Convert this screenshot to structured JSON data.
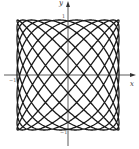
{
  "chart_data": {
    "type": "line",
    "subtype": "parametric-lissajous",
    "title": "",
    "xlabel": "x",
    "ylabel": "y",
    "x_tick_labels": [
      "−1",
      "1"
    ],
    "y_tick_labels": [
      "1",
      "−1"
    ],
    "xlim": [
      -1,
      1
    ],
    "ylim": [
      -1,
      1
    ],
    "grid": false,
    "legend": null,
    "parametric": {
      "x_expr": "sin(9t)",
      "y_expr": "sin(10t)",
      "a": 9,
      "b": 10,
      "phase": 0.3,
      "t_range": [
        0,
        6.2832
      ]
    },
    "line_color": "#1a1a1a"
  },
  "axes": {
    "x_label": "x",
    "y_label": "y",
    "x_min_tick": "−1",
    "y_max_tick": "1",
    "y_min_tick": "−1"
  }
}
